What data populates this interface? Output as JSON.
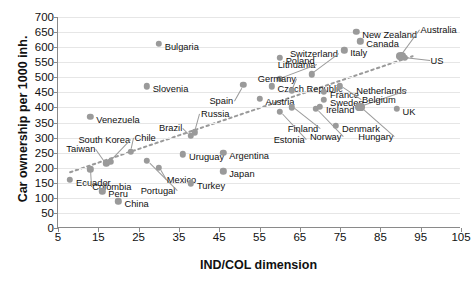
{
  "chart_data": {
    "type": "scatter",
    "title": "",
    "xlabel": "IND/COL dimension",
    "ylabel": "Car ownership per 1000 inh.",
    "xlim": [
      5,
      105
    ],
    "ylim": [
      0,
      700
    ],
    "xticks": [
      5,
      15,
      25,
      35,
      45,
      55,
      65,
      75,
      85,
      95,
      105
    ],
    "yticks": [
      0,
      50,
      100,
      150,
      200,
      250,
      300,
      350,
      400,
      450,
      500,
      550,
      600,
      650,
      700
    ],
    "grid": true,
    "legend": "none",
    "marker_color": "#9a9a9a",
    "trendline": {
      "style": "dotted",
      "color": "#9a9a9a",
      "x_start": 8,
      "y_start": 185,
      "x_end": 93,
      "y_end": 570
    },
    "points": [
      {
        "label": "Ecuador",
        "x": 8,
        "y": 160,
        "label_dx": 6,
        "label_dy": 3
      },
      {
        "label": "Taiwan",
        "x": 17,
        "y": 215,
        "label_dx": -40,
        "label_dy": -14,
        "leader": true
      },
      {
        "label": "Colombia",
        "x": 13,
        "y": 195,
        "label_dx": 2,
        "label_dy": 18,
        "leader": true
      },
      {
        "label": "South Korea",
        "x": 18,
        "y": 220,
        "label_dx": -32,
        "label_dy": -22,
        "leader": true
      },
      {
        "label": "Peru",
        "x": 16,
        "y": 122,
        "label_dx": 6,
        "label_dy": 3
      },
      {
        "label": "China",
        "x": 20,
        "y": 88,
        "label_dx": 6,
        "label_dy": 3
      },
      {
        "label": "Venezuela",
        "x": 13,
        "y": 368,
        "label_dx": 6,
        "label_dy": 3
      },
      {
        "label": "Chile",
        "x": 23,
        "y": 253,
        "label_dx": 4,
        "label_dy": -14,
        "leader": true
      },
      {
        "label": "Slovenia",
        "x": 27,
        "y": 470,
        "label_dx": 6,
        "label_dy": 3
      },
      {
        "label": "Bulgaria",
        "x": 30,
        "y": 612,
        "label_dx": 6,
        "label_dy": 3
      },
      {
        "label": "Portugal",
        "x": 27,
        "y": 222,
        "label_dx": -6,
        "label_dy": 30,
        "leader": true
      },
      {
        "label": "Mexico",
        "x": 30,
        "y": 200,
        "label_dx": 8,
        "label_dy": 12,
        "leader": true
      },
      {
        "label": "Turkey",
        "x": 38,
        "y": 148,
        "label_dx": 6,
        "label_dy": 3
      },
      {
        "label": "Uruguay",
        "x": 36,
        "y": 245,
        "label_dx": 6,
        "label_dy": 3
      },
      {
        "label": "Brazil",
        "x": 38,
        "y": 305,
        "label_dx": -32,
        "label_dy": -8,
        "leader": true
      },
      {
        "label": "Russia",
        "x": 39,
        "y": 318,
        "label_dx": 6,
        "label_dy": -18,
        "leader": true
      },
      {
        "label": "Spain",
        "x": 51,
        "y": 475,
        "label_dx": -34,
        "label_dy": 16,
        "leader": true
      },
      {
        "label": "Argentina",
        "x": 46,
        "y": 250,
        "label_dx": 6,
        "label_dy": 3
      },
      {
        "label": "Japan",
        "x": 46,
        "y": 188,
        "label_dx": 6,
        "label_dy": 3
      },
      {
        "label": "Czech Republic",
        "x": 58,
        "y": 470,
        "label_dx": 6,
        "label_dy": 3
      },
      {
        "label": "Lithuania",
        "x": 60,
        "y": 495,
        "label_dx": -2,
        "label_dy": -14,
        "leader": true
      },
      {
        "label": "Austria",
        "x": 55,
        "y": 428,
        "label_dx": 6,
        "label_dy": 3
      },
      {
        "label": "Estonia",
        "x": 60,
        "y": 385,
        "label_dx": -6,
        "label_dy": 28,
        "leader": true
      },
      {
        "label": "Germany",
        "x": 63,
        "y": 455,
        "label_dx": -34,
        "label_dy": -12,
        "leader": true
      },
      {
        "label": "Finland",
        "x": 63,
        "y": 400,
        "label_dx": -4,
        "label_dy": 22,
        "leader": true
      },
      {
        "label": "Poland",
        "x": 60,
        "y": 565,
        "label_dx": 6,
        "label_dy": 3
      },
      {
        "label": "Switzerland",
        "x": 68,
        "y": 510,
        "label_dx": -22,
        "label_dy": -20,
        "leader": true
      },
      {
        "label": "France",
        "x": 71,
        "y": 452,
        "label_dx": 6,
        "label_dy": 3
      },
      {
        "label": "Sweden",
        "x": 71,
        "y": 425,
        "label_dx": 6,
        "label_dy": 3
      },
      {
        "label": "Ireland",
        "x": 70,
        "y": 402,
        "label_dx": 6,
        "label_dy": 3
      },
      {
        "label": "Norway",
        "x": 69,
        "y": 395,
        "label_dx": -6,
        "label_dy": 28,
        "leader": true
      },
      {
        "label": "Italy",
        "x": 76,
        "y": 590,
        "label_dx": 6,
        "label_dy": 3
      },
      {
        "label": "Canada",
        "x": 80,
        "y": 620,
        "label_dx": 6,
        "label_dy": 3
      },
      {
        "label": "New Zealand",
        "x": 79,
        "y": 650,
        "label_dx": 6,
        "label_dy": 3
      },
      {
        "label": "Denmark",
        "x": 74,
        "y": 340,
        "label_dx": 6,
        "label_dy": 3
      },
      {
        "label": "Netherlands",
        "x": 80,
        "y": 400,
        "label_dx": -4,
        "label_dy": -16,
        "leader": true,
        "wide": true
      },
      {
        "label": "Hungary",
        "x": 80,
        "y": 400,
        "label_dx": -2,
        "label_dy": 30,
        "leader": true
      },
      {
        "label": "UK",
        "x": 89,
        "y": 395,
        "label_dx": 6,
        "label_dy": 3
      },
      {
        "label": "Belgium",
        "x": 75,
        "y": 470,
        "label_dx": 22,
        "label_dy": 14,
        "leader": true
      },
      {
        "label": "Australia",
        "x": 90,
        "y": 570,
        "label_dx": 20,
        "label_dy": -26,
        "leader": true,
        "wide": true
      },
      {
        "label": "US",
        "x": 91,
        "y": 565,
        "label_dx": 26,
        "label_dy": 3,
        "leader": true
      }
    ]
  }
}
